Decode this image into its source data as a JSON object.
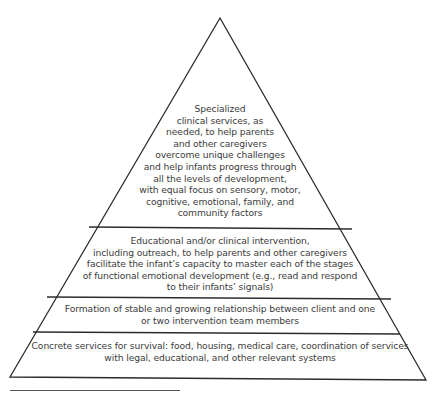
{
  "diagram": {
    "type": "pyramid",
    "tiers": [
      {
        "level": 4,
        "position": "top",
        "lines": [
          "Specialized",
          "clinical services, as",
          "needed, to help parents",
          "and other caregivers",
          "overcome unique challenges",
          "and help infants progress through",
          "all the levels of development,",
          "with equal focus on sensory, motor,",
          "cognitive, emotional, family, and",
          "community factors"
        ]
      },
      {
        "level": 3,
        "position": "upper-middle",
        "lines": [
          "Educational and/or clinical intervention,",
          "including outreach, to help parents and other caregivers",
          "facilitate the infant’s capacity to master each of the stages",
          "of functional emotional development (e.g., read and respond",
          "to their infants’ signals)"
        ]
      },
      {
        "level": 2,
        "position": "lower-middle",
        "lines": [
          "Formation of stable and growing relationship between client and one",
          "or two intervention team members"
        ]
      },
      {
        "level": 1,
        "position": "base",
        "lines": [
          "Concrete services for survival: food, housing, medical care, coordination of services",
          "with legal, educational, and other relevant systems"
        ]
      }
    ],
    "colors": {
      "stroke": "#2b2b2b",
      "text": "#3c3c3c",
      "background": "#ffffff"
    }
  }
}
